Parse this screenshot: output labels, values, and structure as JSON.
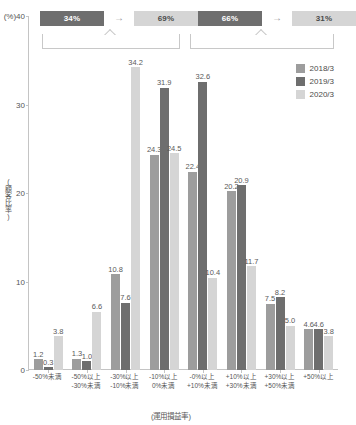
{
  "chart_data": {
    "type": "bar",
    "title": "",
    "xlabel": "(運用損益率)",
    "ylabel": "(顧客比率)",
    "yunit": "(%)",
    "ylim": [
      0,
      40
    ],
    "yticks": [
      0,
      10,
      20,
      30,
      40
    ],
    "grid": false,
    "legend_position": "right",
    "categories": [
      "-50%未満",
      "-50%以上\n-30%未満",
      "-30%以上\n-10%未満",
      "-10%以上\n0%未満",
      "-0%以上\n+10%未満",
      "+10%以上\n+30%未満",
      "+30%以上\n+50%未満",
      "+50%以上"
    ],
    "series": [
      {
        "name": "2018/3",
        "color": "#9d9d9d",
        "values": [
          1.2,
          1.3,
          10.8,
          24.3,
          22.4,
          20.2,
          7.5,
          4.6
        ]
      },
      {
        "name": "2019/3",
        "color": "#6e6e6e",
        "values": [
          0.3,
          1.0,
          7.6,
          31.9,
          32.6,
          20.9,
          8.2,
          4.6
        ]
      },
      {
        "name": "2020/3",
        "color": "#d5d5d5",
        "values": [
          3.8,
          6.6,
          34.2,
          24.5,
          10.4,
          11.7,
          5.0,
          3.8
        ]
      }
    ],
    "annotations": [
      {
        "id": "loss-bracket",
        "from": "34%",
        "to": "69%",
        "arrow": "→",
        "spans_categories": [
          0,
          3
        ]
      },
      {
        "id": "gain-bracket",
        "from": "66%",
        "to": "31%",
        "arrow": "→",
        "spans_categories": [
          4,
          7
        ]
      }
    ]
  },
  "xaxis": {
    "labels": [
      {
        "line1": "-50%未満",
        "line2": ""
      },
      {
        "line1": "-50%以上",
        "line2": "-30%未満"
      },
      {
        "line1": "-30%以上",
        "line2": "-10%未満"
      },
      {
        "line1": "-10%以上",
        "line2": "0%未満"
      },
      {
        "line1": "-0%以上",
        "line2": "+10%未満"
      },
      {
        "line1": "+10%以上",
        "line2": "+30%未満"
      },
      {
        "line1": "+30%以上",
        "line2": "+50%未満"
      },
      {
        "line1": "+50%以上",
        "line2": ""
      }
    ],
    "title": "(運用損益率)"
  },
  "yaxis": {
    "unit": "(%)",
    "title": "(顧客比率)",
    "ticks": [
      "40",
      "30",
      "20",
      "10",
      "0"
    ]
  },
  "legend": {
    "items": [
      {
        "label": "2018/3",
        "color": "#9d9d9d"
      },
      {
        "label": "2019/3",
        "color": "#6e6e6e"
      },
      {
        "label": "2020/3",
        "color": "#d5d5d5"
      }
    ]
  },
  "summary": {
    "left": {
      "from": "34%",
      "arrow": "→",
      "to": "69%"
    },
    "right": {
      "from": "66%",
      "arrow": "→",
      "to": "31%"
    }
  },
  "colors": {
    "series_2018": "#9d9d9d",
    "series_2019": "#6e6e6e",
    "series_2020": "#d5d5d5",
    "axis": "#c4c4c4",
    "text": "#4a4a4a"
  }
}
